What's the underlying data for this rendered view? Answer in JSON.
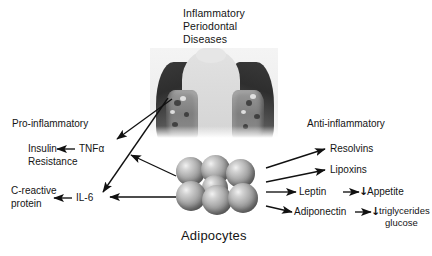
{
  "figure": {
    "title_lines": [
      "Inflammatory",
      "Periodontal",
      "Diseases"
    ],
    "center_label": "Adipocytes",
    "center_image_name": "periodontal-histology-illustration"
  },
  "left_branch": {
    "heading": "Pro-inflammatory",
    "items": [
      {
        "source": "TNFα",
        "target_line1": "Insulin",
        "target_line2": "Resistance"
      },
      {
        "source": "IL-6",
        "target_line1": "C-reactive",
        "target_line2": "protein"
      }
    ]
  },
  "right_branch": {
    "heading": "Anti-inflammatory",
    "items": [
      {
        "mediator": "Resolvins",
        "effect": "",
        "effect2": "",
        "down_arrow": ""
      },
      {
        "mediator": "Lipoxins",
        "effect": "",
        "effect2": "",
        "down_arrow": ""
      },
      {
        "mediator": "Leptin",
        "effect": "Appetite",
        "effect2": "",
        "down_arrow": "↓"
      },
      {
        "mediator": "Adiponectin",
        "effect": "triglycerides",
        "effect2": "glucose",
        "down_arrow": "↓"
      }
    ]
  },
  "colors": {
    "background": "#ffffff",
    "text": "#141414",
    "arrow": "#111111",
    "cell_light": "#f2f2f2",
    "cell_dark": "#4c4c4c",
    "crown": "#dcdcdc",
    "gingiva": "#2e2e2e"
  }
}
